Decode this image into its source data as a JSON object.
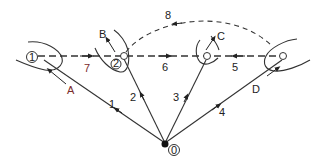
{
  "diagram": {
    "type": "vector-path-diagram",
    "colors": {
      "line": "#333333",
      "label": "#222222",
      "accent_label": "#7a2b2b",
      "background": "#ffffff"
    },
    "origin": {
      "label": "0"
    },
    "nodes": [
      {
        "id": "n1",
        "label": "1"
      },
      {
        "id": "n2",
        "label": "2"
      }
    ],
    "solid_edges": [
      {
        "label": "1",
        "from": "origin",
        "to": "node-1"
      },
      {
        "label": "2",
        "from": "origin",
        "to": "node-2"
      },
      {
        "label": "3",
        "from": "origin",
        "to": "node-C"
      },
      {
        "label": "4",
        "from": "origin",
        "to": "node-D"
      }
    ],
    "dashed_edges": [
      {
        "label": "7",
        "from": "node-1",
        "to": "node-2"
      },
      {
        "label": "6",
        "from": "node-2",
        "to": "node-C"
      },
      {
        "label": "5",
        "from": "node-D",
        "to": "node-C"
      },
      {
        "label": "8",
        "from": "node-D",
        "to": "node-2",
        "curved": true
      }
    ],
    "direction_labels": [
      {
        "label": "A"
      },
      {
        "label": "B"
      },
      {
        "label": "C"
      },
      {
        "label": "D"
      }
    ]
  }
}
